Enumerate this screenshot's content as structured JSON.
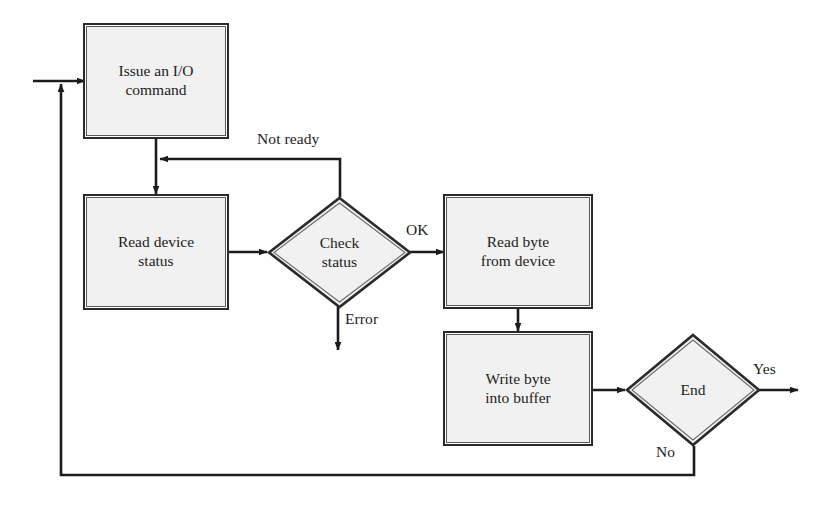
{
  "diagram": {
    "type": "flowchart",
    "colors": {
      "background": "#ffffff",
      "node_fill": "#f1f1f1",
      "node_border_outer": "#2b2b2b",
      "node_border_inner": "#5a5a5a",
      "line": "#1c1c1c",
      "text": "#1c1c1c"
    },
    "nodes": [
      {
        "id": "issue-io-command",
        "shape": "process",
        "label": "Issue an I/O\ncommand",
        "x": 86,
        "y": 26,
        "w": 140,
        "h": 110
      },
      {
        "id": "read-device-status",
        "shape": "process",
        "label": "Read device\nstatus",
        "x": 86,
        "y": 197,
        "w": 140,
        "h": 110
      },
      {
        "id": "check-status",
        "shape": "decision",
        "label": "Check\nstatus",
        "x": 269,
        "y": 198,
        "w": 141,
        "h": 109
      },
      {
        "id": "read-byte-from-device",
        "shape": "process",
        "label": "Read byte\nfrom device",
        "x": 446,
        "y": 197,
        "w": 144,
        "h": 109
      },
      {
        "id": "write-byte-into-buffer",
        "shape": "process",
        "label": "Write byte\ninto buffer",
        "x": 446,
        "y": 334,
        "w": 144,
        "h": 109
      },
      {
        "id": "end-decision",
        "shape": "decision",
        "label": "End",
        "x": 627,
        "y": 335,
        "w": 132,
        "h": 110
      }
    ],
    "edge_labels": [
      {
        "id": "not-ready",
        "text": "Not ready",
        "x": 257,
        "y": 130
      },
      {
        "id": "ok",
        "text": "OK",
        "x": 406,
        "y": 221
      },
      {
        "id": "error",
        "text": "Error",
        "x": 345,
        "y": 310
      },
      {
        "id": "yes",
        "text": "Yes",
        "x": 753,
        "y": 360
      },
      {
        "id": "no",
        "text": "No",
        "x": 656,
        "y": 443
      }
    ],
    "edges": [
      {
        "id": "entry-to-issue",
        "from": "entry",
        "to": "issue-io-command"
      },
      {
        "id": "issue-to-read-status",
        "from": "issue-io-command",
        "to": "read-device-status"
      },
      {
        "id": "read-status-to-check",
        "from": "read-device-status",
        "to": "check-status"
      },
      {
        "id": "check-not-ready-loop",
        "from": "check-status",
        "to": "issue-to-read-status-line",
        "label": "Not ready"
      },
      {
        "id": "check-ok-to-read-byte",
        "from": "check-status",
        "to": "read-byte-from-device",
        "label": "OK"
      },
      {
        "id": "check-error-exit",
        "from": "check-status",
        "to": "error-exit",
        "label": "Error"
      },
      {
        "id": "read-byte-to-write-byte",
        "from": "read-byte-from-device",
        "to": "write-byte-into-buffer"
      },
      {
        "id": "write-byte-to-end",
        "from": "write-byte-into-buffer",
        "to": "end-decision"
      },
      {
        "id": "end-yes-exit",
        "from": "end-decision",
        "to": "exit",
        "label": "Yes"
      },
      {
        "id": "end-no-loop",
        "from": "end-decision",
        "to": "issue-io-command",
        "label": "No"
      }
    ]
  }
}
